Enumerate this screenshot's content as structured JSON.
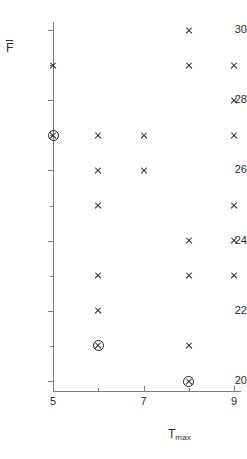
{
  "chart_data": {
    "type": "scatter",
    "title": "",
    "xlabel": "T_max",
    "ylabel": "F̄",
    "xlabel_base": "T",
    "xlabel_sub": "max",
    "ylabel_base": "F",
    "xlim": [
      4.5,
      9.6
    ],
    "ylim": [
      19.4,
      30.4
    ],
    "grid": false,
    "legend": null,
    "x_ticks": [
      5,
      6,
      7,
      8,
      9
    ],
    "x_tick_labels": [
      "5",
      "",
      "7",
      "",
      "9"
    ],
    "x_major_ticks": [
      5,
      7,
      9
    ],
    "y_ticks": [
      20,
      21,
      22,
      23,
      24,
      25,
      26,
      27,
      28,
      29,
      30
    ],
    "y_tick_labels": [
      "20",
      "",
      "22",
      "",
      "24",
      "",
      "26",
      "",
      "28",
      "",
      "30"
    ],
    "y_major_ticks": [
      20,
      22,
      24,
      26,
      28,
      30
    ],
    "marker_plain": "x",
    "marker_highlighted": "circled-x",
    "points": [
      {
        "x": 5,
        "y": 29,
        "marker": "x"
      },
      {
        "x": 5,
        "y": 27,
        "marker": "circled-x"
      },
      {
        "x": 6,
        "y": 27,
        "marker": "x"
      },
      {
        "x": 6,
        "y": 26,
        "marker": "x"
      },
      {
        "x": 6,
        "y": 25,
        "marker": "x"
      },
      {
        "x": 6,
        "y": 23,
        "marker": "x"
      },
      {
        "x": 6,
        "y": 22,
        "marker": "x"
      },
      {
        "x": 6,
        "y": 21,
        "marker": "circled-x"
      },
      {
        "x": 7,
        "y": 27,
        "marker": "x"
      },
      {
        "x": 7,
        "y": 26,
        "marker": "x"
      },
      {
        "x": 8,
        "y": 30,
        "marker": "x"
      },
      {
        "x": 8,
        "y": 29,
        "marker": "x"
      },
      {
        "x": 8,
        "y": 24,
        "marker": "x"
      },
      {
        "x": 8,
        "y": 23,
        "marker": "x"
      },
      {
        "x": 8,
        "y": 21,
        "marker": "x"
      },
      {
        "x": 8,
        "y": 20,
        "marker": "circled-x"
      },
      {
        "x": 9,
        "y": 29,
        "marker": "x"
      },
      {
        "x": 9,
        "y": 28,
        "marker": "x"
      },
      {
        "x": 9,
        "y": 27,
        "marker": "x"
      },
      {
        "x": 9,
        "y": 25,
        "marker": "x"
      },
      {
        "x": 9,
        "y": 24,
        "marker": "x"
      },
      {
        "x": 9,
        "y": 23,
        "marker": "x"
      }
    ],
    "colors": {
      "axis": "#7d7d7d",
      "marker": "#222222",
      "text": "#2b2b2b",
      "background": "#ffffff"
    }
  }
}
